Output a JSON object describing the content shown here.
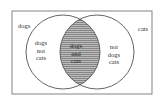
{
  "diagram": {
    "type": "venn",
    "sets": [
      {
        "id": "dogs",
        "label": "dogs"
      },
      {
        "id": "cats",
        "label": "cats"
      }
    ],
    "regions": {
      "dogs_only": {
        "lines": [
          "dogs",
          "not",
          "cats"
        ]
      },
      "both": {
        "lines": [
          "dogs",
          "and",
          "cats"
        ],
        "fill": "#b8b8b8",
        "pattern": "horizontal-lines"
      },
      "cats_only": {
        "lines": [
          "not",
          "dogs",
          "cats"
        ]
      }
    },
    "colors": {
      "stroke": "#555555",
      "intersection_fill": "#b8b8b8",
      "hatch": "#7a7a7a",
      "background": "#ffffff"
    }
  }
}
